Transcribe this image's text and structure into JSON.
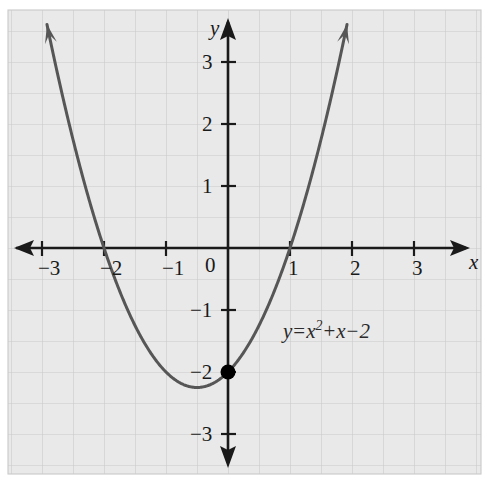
{
  "figure": {
    "background_color": "#ffffff",
    "plot_background_color": "#e9e9e9",
    "grid_color": "#c9c9c9",
    "axis_color": "#1a1a1a",
    "curve_color": "#565656",
    "point_color": "#000000"
  },
  "axes": {
    "x_name": "x",
    "y_name": "y",
    "origin_label": "0"
  },
  "equation": {
    "lhs": "y",
    "equals": "=",
    "var1": "x",
    "exponent": "2",
    "plus": "+",
    "var2": "x",
    "minus": "−",
    "constant": "2",
    "full_text": "y = x² + x − 2"
  },
  "chart_data": {
    "type": "line",
    "title": "",
    "subtitle": "",
    "xlabel": "x",
    "ylabel": "y",
    "function": "y = x^2 + x - 2",
    "grid": true,
    "grid_step": 0.5,
    "legend": "none",
    "xlim": [
      -3.55,
      3.85
    ],
    "ylim": [
      -3.6,
      3.55
    ],
    "x_ticks": [
      -3,
      -2,
      -1,
      0,
      1,
      2,
      3
    ],
    "x_tick_labels": [
      "−3",
      "−2",
      "−1",
      "0",
      "1",
      "2",
      "3"
    ],
    "y_ticks": [
      3,
      2,
      1,
      -1,
      -2,
      -3
    ],
    "y_tick_labels": [
      "3",
      "2",
      "1",
      "−1",
      "−2",
      "−3"
    ],
    "roots": [
      -2,
      1
    ],
    "vertex": [
      -0.5,
      -2.25
    ],
    "y_intercept": [
      0,
      -2
    ],
    "series": [
      {
        "name": "y = x^2 + x - 2",
        "x": [
          -2.9,
          -2.8,
          -2.7,
          -2.6,
          -2.5,
          -2.4,
          -2.3,
          -2.2,
          -2.1,
          -2.0,
          -1.9,
          -1.8,
          -1.7,
          -1.6,
          -1.5,
          -1.4,
          -1.3,
          -1.2,
          -1.1,
          -1.0,
          -0.9,
          -0.8,
          -0.7,
          -0.6,
          -0.5,
          -0.4,
          -0.3,
          -0.2,
          -0.1,
          0.0,
          0.1,
          0.2,
          0.3,
          0.4,
          0.5,
          0.6,
          0.7,
          0.8,
          0.9,
          1.0,
          1.1,
          1.2,
          1.3,
          1.4,
          1.5,
          1.6,
          1.7,
          1.8,
          1.9
        ],
        "y": [
          3.51,
          3.04,
          2.59,
          2.16,
          1.75,
          1.36,
          0.99,
          0.64,
          0.31,
          0.0,
          -0.29,
          -0.56,
          -0.81,
          -1.04,
          -1.25,
          -1.44,
          -1.61,
          -1.76,
          -1.89,
          -2.0,
          -2.09,
          -2.16,
          -2.21,
          -2.24,
          -2.25,
          -2.24,
          -2.21,
          -2.16,
          -2.09,
          -2.0,
          -1.89,
          -1.76,
          -1.61,
          -1.44,
          -1.25,
          -1.04,
          -0.81,
          -0.56,
          -0.29,
          0.0,
          0.31,
          0.64,
          0.99,
          1.36,
          1.75,
          2.16,
          2.59,
          3.04,
          3.51
        ]
      }
    ],
    "marked_points": [
      {
        "label": "y-intercept",
        "x": 0,
        "y": -2,
        "style": "filled-circle"
      }
    ],
    "annotations": [
      {
        "text": "y = x² + x − 2",
        "x": 0.95,
        "y": -1.35
      }
    ]
  },
  "x_tick_items": [
    {
      "label": "−3",
      "left": 38,
      "top": 258
    },
    {
      "label": "−2",
      "left": 100,
      "top": 258
    },
    {
      "label": "−1",
      "left": 162,
      "top": 258
    },
    {
      "label": "0",
      "left": 205,
      "top": 255
    },
    {
      "label": "1",
      "left": 288,
      "top": 258
    },
    {
      "label": "2",
      "left": 350,
      "top": 258
    },
    {
      "label": "3",
      "left": 412,
      "top": 258
    }
  ],
  "y_tick_items": [
    {
      "label": "3",
      "left": 202,
      "top": 44
    },
    {
      "label": "2",
      "left": 202,
      "top": 106
    },
    {
      "label": "1",
      "left": 202,
      "top": 168
    },
    {
      "label": "−1",
      "left": 192,
      "top": 292
    },
    {
      "label": "−2",
      "left": 192,
      "top": 354
    },
    {
      "label": "−3",
      "left": 192,
      "top": 440
    }
  ]
}
